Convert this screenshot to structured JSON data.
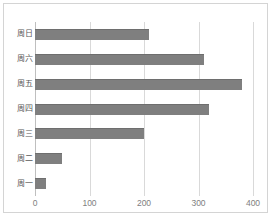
{
  "chart_data": {
    "type": "bar",
    "orientation": "horizontal",
    "title": "",
    "xlabel": "",
    "ylabel": "",
    "categories": [
      "周一",
      "周二",
      "周三",
      "周四",
      "周五",
      "周六",
      "周日"
    ],
    "values": [
      20,
      50,
      200,
      320,
      380,
      310,
      210
    ],
    "series": [
      {
        "name": "",
        "values": [
          20,
          50,
          200,
          320,
          380,
          310,
          210
        ]
      }
    ],
    "display_order_top_to_bottom": [
      "周日",
      "周六",
      "周五",
      "周四",
      "周三",
      "周二",
      "周一"
    ],
    "xlim": [
      0,
      400
    ],
    "xticks": [
      0,
      100,
      200,
      300,
      400
    ],
    "xtick_labels": [
      "0",
      "100",
      "200",
      "300",
      "400"
    ],
    "grid": true,
    "grid_axis": "x",
    "legend": false,
    "legend_position": "none",
    "bar_color": "#7f7f7f",
    "gridline_color": "#d9d9d9",
    "border_color": "#d4d4d4",
    "tick_label_color": "#808080",
    "category_label_color": "#595959"
  },
  "rows": [
    {
      "label": "周日",
      "value": 210
    },
    {
      "label": "周六",
      "value": 310
    },
    {
      "label": "周五",
      "value": 380
    },
    {
      "label": "周四",
      "value": 320
    },
    {
      "label": "周三",
      "value": 200
    },
    {
      "label": "周二",
      "value": 50
    },
    {
      "label": "周一",
      "value": 20
    }
  ],
  "xticks": [
    {
      "label": "0",
      "value": 0
    },
    {
      "label": "100",
      "value": 100
    },
    {
      "label": "200",
      "value": 200
    },
    {
      "label": "300",
      "value": 300
    },
    {
      "label": "400",
      "value": 400
    }
  ]
}
